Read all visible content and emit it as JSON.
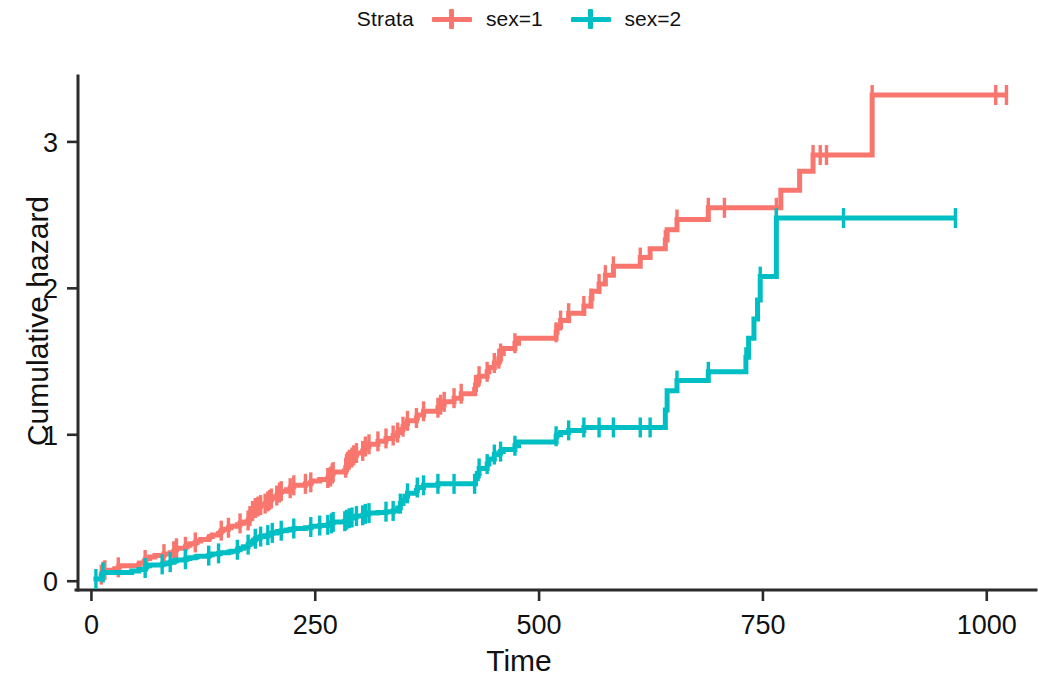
{
  "legend": {
    "title": "Strata",
    "entries": [
      {
        "label": "sex=1",
        "color": "#F8766D",
        "key_name": "legend-key-sex-1"
      },
      {
        "label": "sex=2",
        "color": "#00BFC4",
        "key_name": "legend-key-sex-2"
      }
    ]
  },
  "chart_data": {
    "type": "line",
    "title": "",
    "subtitle": "",
    "xlabel": "Time",
    "ylabel": "Cumulative hazard",
    "xlim": [
      -15,
      1055
    ],
    "ylim": [
      -0.06,
      3.45
    ],
    "xticks": [
      0,
      250,
      500,
      750,
      1000
    ],
    "yticks": [
      0,
      1,
      2,
      3
    ],
    "xticklabels": [
      "0",
      "250",
      "500",
      "750",
      "1000"
    ],
    "yticklabels": [
      "0",
      "1",
      "2",
      "3"
    ],
    "grid": false,
    "legend_position": "top",
    "step": "hv",
    "series": [
      {
        "name": "sex=1",
        "color": "#F8766D",
        "points": [
          [
            11,
            0.0
          ],
          [
            11,
            0.045
          ],
          [
            12,
            0.055
          ],
          [
            13,
            0.065
          ],
          [
            15,
            0.075
          ],
          [
            26,
            0.085
          ],
          [
            30,
            0.095
          ],
          [
            31,
            0.105
          ],
          [
            53,
            0.115
          ],
          [
            54,
            0.125
          ],
          [
            59,
            0.135
          ],
          [
            60,
            0.145
          ],
          [
            61,
            0.155
          ],
          [
            65,
            0.165
          ],
          [
            71,
            0.175
          ],
          [
            81,
            0.185
          ],
          [
            88,
            0.195
          ],
          [
            92,
            0.205
          ],
          [
            93,
            0.215
          ],
          [
            95,
            0.225
          ],
          [
            105,
            0.235
          ],
          [
            107,
            0.245
          ],
          [
            110,
            0.255
          ],
          [
            116,
            0.265
          ],
          [
            118,
            0.275
          ],
          [
            122,
            0.285
          ],
          [
            131,
            0.295
          ],
          [
            132,
            0.305
          ],
          [
            135,
            0.315
          ],
          [
            142,
            0.325
          ],
          [
            144,
            0.335
          ],
          [
            145,
            0.345
          ],
          [
            147,
            0.355
          ],
          [
            153,
            0.365
          ],
          [
            156,
            0.375
          ],
          [
            163,
            0.385
          ],
          [
            166,
            0.395
          ],
          [
            170,
            0.405
          ],
          [
            175,
            0.415
          ],
          [
            176,
            0.425
          ],
          [
            177,
            0.445
          ],
          [
            179,
            0.465
          ],
          [
            180,
            0.48
          ],
          [
            181,
            0.49
          ],
          [
            183,
            0.5
          ],
          [
            186,
            0.51
          ],
          [
            189,
            0.52
          ],
          [
            194,
            0.53
          ],
          [
            197,
            0.545
          ],
          [
            199,
            0.555
          ],
          [
            201,
            0.565
          ],
          [
            202,
            0.575
          ],
          [
            207,
            0.585
          ],
          [
            208,
            0.595
          ],
          [
            210,
            0.605
          ],
          [
            212,
            0.615
          ],
          [
            218,
            0.625
          ],
          [
            222,
            0.635
          ],
          [
            223,
            0.645
          ],
          [
            226,
            0.655
          ],
          [
            239,
            0.665
          ],
          [
            245,
            0.675
          ],
          [
            246,
            0.685
          ],
          [
            255,
            0.695
          ],
          [
            264,
            0.705
          ],
          [
            267,
            0.715
          ],
          [
            268,
            0.725
          ],
          [
            269,
            0.735
          ],
          [
            270,
            0.745
          ],
          [
            283,
            0.755
          ],
          [
            284,
            0.775
          ],
          [
            285,
            0.8
          ],
          [
            286,
            0.815
          ],
          [
            288,
            0.83
          ],
          [
            291,
            0.845
          ],
          [
            293,
            0.86
          ],
          [
            296,
            0.875
          ],
          [
            303,
            0.89
          ],
          [
            305,
            0.905
          ],
          [
            306,
            0.92
          ],
          [
            310,
            0.935
          ],
          [
            320,
            0.955
          ],
          [
            329,
            0.975
          ],
          [
            337,
            0.995
          ],
          [
            342,
            1.015
          ],
          [
            345,
            1.035
          ],
          [
            348,
            1.055
          ],
          [
            350,
            1.075
          ],
          [
            353,
            1.095
          ],
          [
            363,
            1.115
          ],
          [
            364,
            1.135
          ],
          [
            371,
            1.16
          ],
          [
            387,
            1.185
          ],
          [
            390,
            1.205
          ],
          [
            394,
            1.225
          ],
          [
            405,
            1.25
          ],
          [
            413,
            1.28
          ],
          [
            428,
            1.31
          ],
          [
            429,
            1.34
          ],
          [
            431,
            1.37
          ],
          [
            433,
            1.4
          ],
          [
            442,
            1.43
          ],
          [
            444,
            1.46
          ],
          [
            450,
            1.49
          ],
          [
            455,
            1.52
          ],
          [
            457,
            1.555
          ],
          [
            460,
            1.59
          ],
          [
            473,
            1.625
          ],
          [
            477,
            1.66
          ],
          [
            519,
            1.7
          ],
          [
            520,
            1.74
          ],
          [
            524,
            1.78
          ],
          [
            533,
            1.83
          ],
          [
            550,
            1.88
          ],
          [
            558,
            1.93
          ],
          [
            559,
            1.98
          ],
          [
            567,
            2.03
          ],
          [
            574,
            2.09
          ],
          [
            583,
            2.15
          ],
          [
            613,
            2.21
          ],
          [
            624,
            2.27
          ],
          [
            641,
            2.33
          ],
          [
            643,
            2.4
          ],
          [
            654,
            2.47
          ],
          [
            689,
            2.55
          ],
          [
            707,
            2.55
          ],
          [
            728,
            2.55
          ],
          [
            731,
            2.55
          ],
          [
            765,
            2.55
          ],
          [
            770,
            2.67
          ],
          [
            791,
            2.8
          ],
          [
            806,
            2.91
          ],
          [
            814,
            2.91
          ],
          [
            821,
            2.91
          ],
          [
            872,
            3.32
          ],
          [
            883,
            3.32
          ],
          [
            1010,
            3.32
          ],
          [
            1022,
            3.32
          ]
        ],
        "censor_times": [
          11,
          13,
          15,
          30,
          60,
          81,
          92,
          95,
          105,
          116,
          145,
          153,
          166,
          175,
          177,
          180,
          183,
          186,
          189,
          194,
          197,
          199,
          201,
          207,
          210,
          212,
          222,
          226,
          239,
          245,
          264,
          267,
          269,
          270,
          284,
          285,
          286,
          288,
          291,
          293,
          296,
          303,
          306,
          310,
          320,
          329,
          337,
          342,
          348,
          353,
          363,
          371,
          387,
          390,
          394,
          405,
          413,
          429,
          433,
          442,
          450,
          455,
          457,
          473,
          519,
          524,
          533,
          550,
          558,
          567,
          574,
          583,
          613,
          641,
          654,
          689,
          707,
          765,
          806,
          814,
          821,
          872,
          1010,
          1022
        ]
      },
      {
        "name": "sex=2",
        "color": "#00BFC4",
        "points": [
          [
            5,
            0.0
          ],
          [
            5,
            0.015
          ],
          [
            11,
            0.03
          ],
          [
            12,
            0.045
          ],
          [
            13,
            0.06
          ],
          [
            45,
            0.07
          ],
          [
            53,
            0.08
          ],
          [
            60,
            0.09
          ],
          [
            61,
            0.1
          ],
          [
            62,
            0.105
          ],
          [
            65,
            0.11
          ],
          [
            79,
            0.115
          ],
          [
            81,
            0.12
          ],
          [
            85,
            0.125
          ],
          [
            88,
            0.13
          ],
          [
            92,
            0.135
          ],
          [
            93,
            0.14
          ],
          [
            95,
            0.145
          ],
          [
            105,
            0.15
          ],
          [
            107,
            0.155
          ],
          [
            110,
            0.16
          ],
          [
            116,
            0.165
          ],
          [
            118,
            0.17
          ],
          [
            131,
            0.175
          ],
          [
            132,
            0.18
          ],
          [
            135,
            0.185
          ],
          [
            142,
            0.19
          ],
          [
            144,
            0.195
          ],
          [
            153,
            0.2
          ],
          [
            156,
            0.205
          ],
          [
            163,
            0.215
          ],
          [
            166,
            0.225
          ],
          [
            170,
            0.235
          ],
          [
            175,
            0.25
          ],
          [
            177,
            0.26
          ],
          [
            179,
            0.27
          ],
          [
            181,
            0.28
          ],
          [
            183,
            0.29
          ],
          [
            186,
            0.3
          ],
          [
            189,
            0.305
          ],
          [
            194,
            0.31
          ],
          [
            197,
            0.315
          ],
          [
            199,
            0.32
          ],
          [
            201,
            0.325
          ],
          [
            202,
            0.33
          ],
          [
            207,
            0.335
          ],
          [
            208,
            0.34
          ],
          [
            212,
            0.345
          ],
          [
            218,
            0.35
          ],
          [
            222,
            0.355
          ],
          [
            226,
            0.36
          ],
          [
            239,
            0.365
          ],
          [
            245,
            0.37
          ],
          [
            246,
            0.375
          ],
          [
            255,
            0.38
          ],
          [
            264,
            0.385
          ],
          [
            267,
            0.39
          ],
          [
            268,
            0.395
          ],
          [
            269,
            0.4
          ],
          [
            270,
            0.405
          ],
          [
            283,
            0.41
          ],
          [
            284,
            0.415
          ],
          [
            285,
            0.42
          ],
          [
            286,
            0.425
          ],
          [
            288,
            0.43
          ],
          [
            291,
            0.435
          ],
          [
            293,
            0.44
          ],
          [
            296,
            0.445
          ],
          [
            303,
            0.45
          ],
          [
            305,
            0.455
          ],
          [
            306,
            0.46
          ],
          [
            310,
            0.465
          ],
          [
            320,
            0.47
          ],
          [
            329,
            0.475
          ],
          [
            337,
            0.48
          ],
          [
            342,
            0.5
          ],
          [
            345,
            0.53
          ],
          [
            348,
            0.555
          ],
          [
            350,
            0.58
          ],
          [
            353,
            0.6
          ],
          [
            363,
            0.62
          ],
          [
            364,
            0.64
          ],
          [
            371,
            0.655
          ],
          [
            387,
            0.665
          ],
          [
            390,
            0.665
          ],
          [
            394,
            0.665
          ],
          [
            405,
            0.665
          ],
          [
            413,
            0.665
          ],
          [
            428,
            0.665
          ],
          [
            429,
            0.7
          ],
          [
            431,
            0.735
          ],
          [
            433,
            0.77
          ],
          [
            442,
            0.8
          ],
          [
            444,
            0.835
          ],
          [
            450,
            0.865
          ],
          [
            455,
            0.875
          ],
          [
            457,
            0.885
          ],
          [
            460,
            0.9
          ],
          [
            473,
            0.925
          ],
          [
            477,
            0.95
          ],
          [
            519,
            0.99
          ],
          [
            520,
            1.0
          ],
          [
            524,
            1.015
          ],
          [
            533,
            1.03
          ],
          [
            550,
            1.05
          ],
          [
            558,
            1.05
          ],
          [
            559,
            1.05
          ],
          [
            567,
            1.05
          ],
          [
            574,
            1.05
          ],
          [
            583,
            1.05
          ],
          [
            613,
            1.05
          ],
          [
            624,
            1.05
          ],
          [
            641,
            1.17
          ],
          [
            643,
            1.3
          ],
          [
            654,
            1.37
          ],
          [
            689,
            1.43
          ],
          [
            707,
            1.43
          ],
          [
            728,
            1.43
          ],
          [
            731,
            1.53
          ],
          [
            734,
            1.66
          ],
          [
            740,
            1.79
          ],
          [
            744,
            1.92
          ],
          [
            747,
            2.08
          ],
          [
            765,
            2.48
          ],
          [
            770,
            2.48
          ],
          [
            791,
            2.48
          ],
          [
            806,
            2.48
          ],
          [
            821,
            2.48
          ],
          [
            840,
            2.48
          ],
          [
            883,
            2.48
          ],
          [
            965,
            2.48
          ]
        ],
        "censor_times": [
          5,
          13,
          60,
          79,
          88,
          105,
          131,
          142,
          163,
          175,
          183,
          189,
          197,
          202,
          212,
          226,
          245,
          255,
          264,
          268,
          270,
          283,
          285,
          288,
          291,
          296,
          303,
          306,
          310,
          329,
          337,
          345,
          353,
          364,
          371,
          387,
          405,
          428,
          433,
          442,
          450,
          457,
          473,
          519,
          533,
          550,
          567,
          583,
          613,
          624,
          654,
          689,
          731,
          747,
          765,
          840,
          965
        ]
      }
    ]
  },
  "axes": {
    "axis_color": "#2b2b2b",
    "background": "#ffffff"
  }
}
